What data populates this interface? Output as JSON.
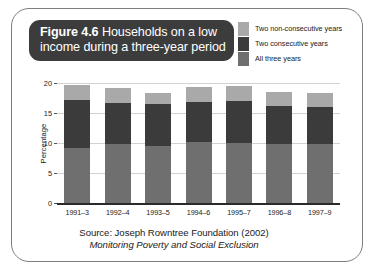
{
  "figure": {
    "title_label": "Figure",
    "title_number": "4.6",
    "title_line1_rest": "Households on a low",
    "title_line2": "income during a three-year period"
  },
  "legend": {
    "items": [
      {
        "label": "Two non-consecutive years",
        "color": "#a9a9a9"
      },
      {
        "label": "Two consecutive years",
        "color": "#3b3b3b"
      },
      {
        "label": "All three years",
        "color": "#6f6f6f"
      }
    ]
  },
  "source": {
    "line1": "Source: Joseph Rowntree Foundation (2002)",
    "line2": "Monitoring Poverty and Social Exclusion"
  },
  "chart_data": {
    "type": "bar",
    "stacked": true,
    "title": "Figure 4.6 Households on a low income during a three-year period",
    "xlabel": "",
    "ylabel": "Percentage",
    "ylim": [
      0,
      20
    ],
    "yticks": [
      0,
      5,
      10,
      15,
      20
    ],
    "grid": true,
    "legend_position": "top-right",
    "categories": [
      "1991–3",
      "1992–4",
      "1993–5",
      "1994–6",
      "1995–7",
      "1996–8",
      "1997–9"
    ],
    "series": [
      {
        "name": "All three years",
        "color": "#6f6f6f",
        "values": [
          9.2,
          9.8,
          9.5,
          10.2,
          10.0,
          9.8,
          9.8
        ]
      },
      {
        "name": "Two consecutive years",
        "color": "#3b3b3b",
        "values": [
          8.0,
          6.9,
          7.0,
          6.7,
          7.0,
          6.4,
          6.2
        ]
      },
      {
        "name": "Two non-consecutive years",
        "color": "#a9a9a9",
        "values": [
          2.5,
          2.4,
          1.8,
          2.4,
          2.5,
          2.3,
          2.3
        ]
      }
    ],
    "totals": [
      19.7,
      19.1,
      18.3,
      19.3,
      19.5,
      18.5,
      18.3
    ]
  }
}
